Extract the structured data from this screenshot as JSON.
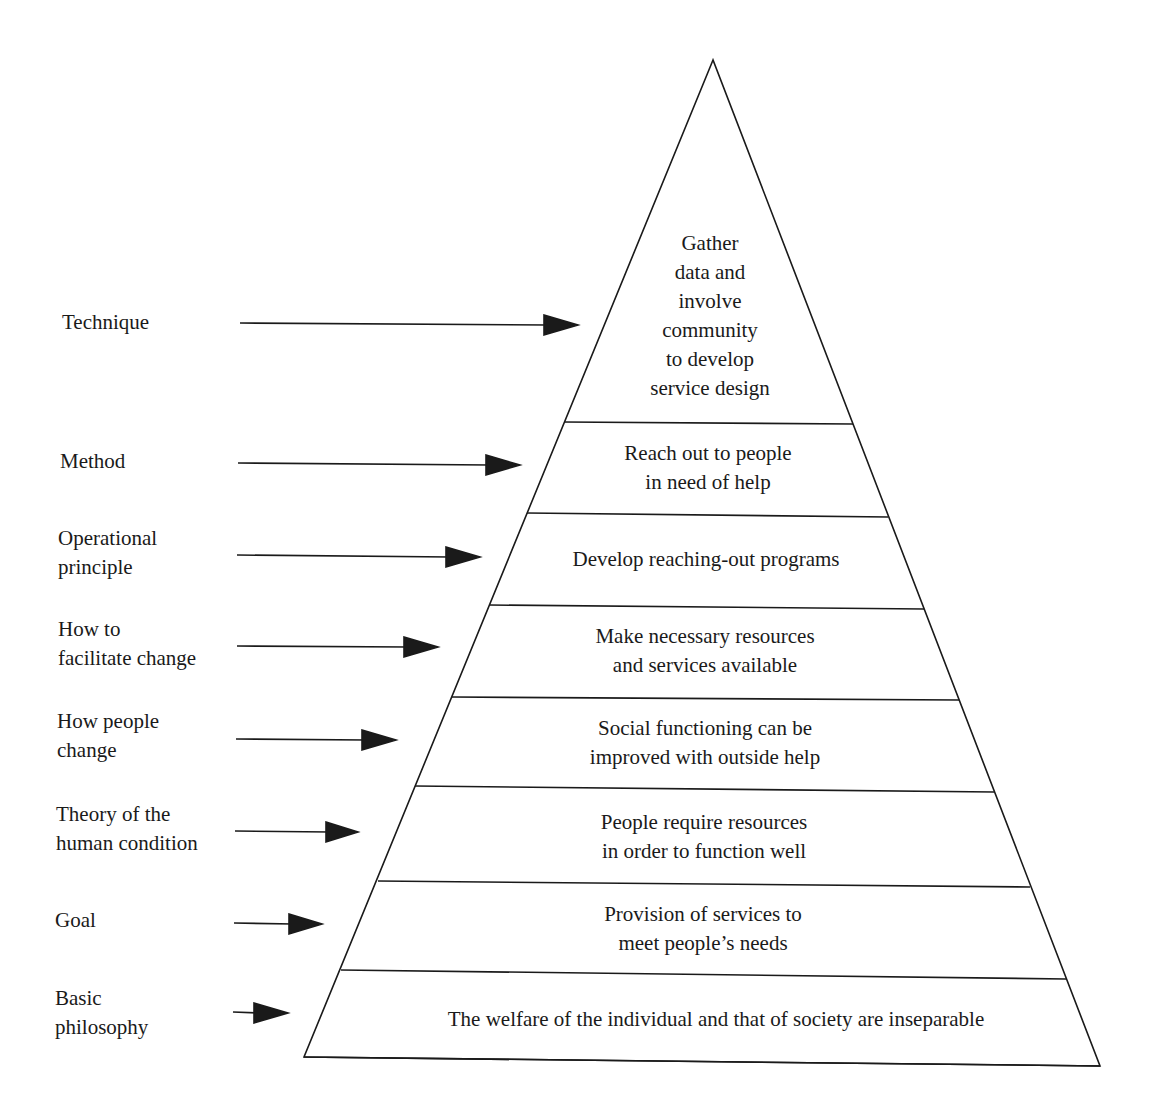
{
  "diagram": {
    "type": "pyramid",
    "colors": {
      "stroke": "#1a1a1a",
      "background": "#ffffff",
      "text": "#1a1a1a"
    },
    "levels": [
      {
        "label": "Technique",
        "content": "Gather\ndata and\ninvolve\ncommunity\nto develop\nservice design"
      },
      {
        "label": "Method",
        "content": "Reach out to people\nin need of help"
      },
      {
        "label": "Operational\nprinciple",
        "content": "Develop reaching-out programs"
      },
      {
        "label": "How to\nfacilitate change",
        "content": "Make necessary resources\nand services available"
      },
      {
        "label": "How people\nchange",
        "content": "Social functioning can be\nimproved with outside help"
      },
      {
        "label": "Theory of the\nhuman condition",
        "content": "People require resources\nin order to function well"
      },
      {
        "label": "Goal",
        "content": "Provision of services to\nmeet people’s needs"
      },
      {
        "label": "Basic\nphilosophy",
        "content": "The welfare of the individual and that of society are inseparable"
      }
    ]
  },
  "labels": {
    "technique": [
      "Technique"
    ],
    "method": [
      "Method"
    ],
    "operational_principle": [
      "Operational",
      "principle"
    ],
    "facilitate_change": [
      "How to",
      "facilitate change"
    ],
    "people_change": [
      "How people",
      "change"
    ],
    "human_condition": [
      "Theory of the",
      "human condition"
    ],
    "goal": [
      "Goal"
    ],
    "basic_philosophy": [
      "Basic",
      "philosophy"
    ]
  },
  "layers": {
    "technique": [
      "Gather",
      "data and",
      "involve",
      "community",
      "to develop",
      "service design"
    ],
    "method": [
      "Reach out to people",
      "in need of help"
    ],
    "operational_principle": [
      "Develop reaching-out programs"
    ],
    "facilitate_change": [
      "Make necessary resources",
      "and services available"
    ],
    "people_change": [
      "Social functioning can be",
      "improved with outside help"
    ],
    "human_condition": [
      "People require resources",
      "in order to function well"
    ],
    "goal": [
      "Provision of services to",
      "meet people’s needs"
    ],
    "basic_philosophy": [
      "The welfare of the individual and that of society are inseparable"
    ]
  }
}
